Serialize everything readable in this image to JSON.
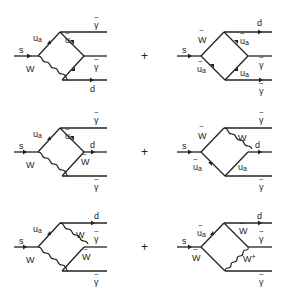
{
  "figure": {
    "operator": "+",
    "diagrams": [
      {
        "id": "d1",
        "incoming": "s",
        "internal": [
          {
            "label": "u",
            "sub": "a",
            "tilde": false,
            "line": "fermion"
          },
          {
            "label": "W",
            "tilde": false,
            "line": "boson"
          },
          {
            "label": "u",
            "sub": "a",
            "tilde": true,
            "line": "fermion"
          }
        ],
        "outgoing": [
          {
            "label": "γ",
            "tilde": true
          },
          {
            "label": "γ",
            "tilde": true
          },
          {
            "label": "d",
            "tilde": false
          }
        ]
      },
      {
        "id": "d2",
        "incoming": "s",
        "internal": [
          {
            "label": "W",
            "tilde": true,
            "line": "fermion"
          },
          {
            "label": "u",
            "sub": "a",
            "tilde": true,
            "line": "scalar"
          },
          {
            "label": "u",
            "sub": "a",
            "tilde": true,
            "line": "scalar"
          },
          {
            "label": "u",
            "sub": "a",
            "tilde": false,
            "line": "fermion"
          }
        ],
        "outgoing": [
          {
            "label": "d",
            "tilde": false
          },
          {
            "label": "γ",
            "tilde": true
          },
          {
            "label": "γ",
            "tilde": true
          }
        ]
      },
      {
        "id": "d3",
        "incoming": "s",
        "internal": [
          {
            "label": "u",
            "sub": "a",
            "tilde": false,
            "line": "fermion"
          },
          {
            "label": "W",
            "tilde": false,
            "line": "boson"
          },
          {
            "label": "u",
            "sub": "a",
            "tilde": true,
            "line": "fermion"
          },
          {
            "label": "W",
            "tilde": true,
            "line": "fermion"
          }
        ],
        "outgoing": [
          {
            "label": "γ",
            "tilde": true
          },
          {
            "label": "d",
            "tilde": false
          },
          {
            "label": "γ",
            "tilde": true
          }
        ]
      },
      {
        "id": "d4",
        "incoming": "s",
        "internal": [
          {
            "label": "W",
            "tilde": true,
            "line": "fermion"
          },
          {
            "label": "u",
            "sub": "a",
            "tilde": true,
            "line": "scalar"
          },
          {
            "label": "W",
            "tilde": false,
            "line": "boson"
          },
          {
            "label": "u",
            "sub": "a",
            "tilde": false,
            "line": "fermion"
          }
        ],
        "outgoing": [
          {
            "label": "γ",
            "tilde": true
          },
          {
            "label": "d",
            "tilde": false
          },
          {
            "label": "γ",
            "tilde": true
          }
        ]
      },
      {
        "id": "d5",
        "incoming": "s",
        "internal": [
          {
            "label": "u",
            "sub": "a",
            "tilde": false,
            "line": "fermion"
          },
          {
            "label": "W",
            "tilde": false,
            "line": "boson"
          },
          {
            "label": "W",
            "tilde": false,
            "line": "boson"
          },
          {
            "label": "W",
            "tilde": true,
            "line": "fermion"
          }
        ],
        "outgoing": [
          {
            "label": "d",
            "tilde": false
          },
          {
            "label": "γ",
            "tilde": true
          },
          {
            "label": "γ",
            "tilde": true
          }
        ]
      },
      {
        "id": "d6",
        "incoming": "s",
        "internal": [
          {
            "label": "u",
            "sub": "a",
            "tilde": true,
            "line": "scalar"
          },
          {
            "label": "W",
            "tilde": true,
            "line": "fermion"
          },
          {
            "label": "W",
            "tilde": true,
            "line": "fermion"
          },
          {
            "label": "W+",
            "tilde": false,
            "line": "boson"
          }
        ],
        "outgoing": [
          {
            "label": "d",
            "tilde": false
          },
          {
            "label": "γ",
            "tilde": true
          },
          {
            "label": "γ",
            "tilde": true
          }
        ]
      }
    ]
  },
  "labels": {
    "s": "s",
    "u": "u",
    "a": "a",
    "W": "W",
    "Wplus": "W",
    "plus_sup": "+",
    "d": "d",
    "gamma": "γ",
    "tilde": "~",
    "plus": "+"
  }
}
